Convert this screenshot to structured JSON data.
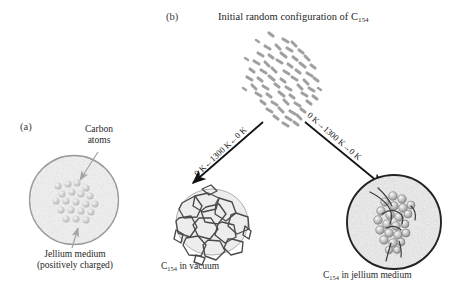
{
  "figure": {
    "panel_a": {
      "label": "(a)",
      "carbon_atoms_label_line1": "Carbon",
      "carbon_atoms_label_line2": "atoms",
      "medium_label_line1": "Jellium medium",
      "medium_label_line2": "(positively charged)",
      "circle_border_color": "#9a9a9a",
      "circle_fill_color": "#f2f2f2",
      "atom_color": "#cfcfcf",
      "atom_count": 20,
      "arrow_color": "#a0a0a0"
    },
    "panel_b": {
      "label": "(b)",
      "title_prefix": "Initial random configuration of C",
      "title_subscript": "154",
      "cluster_color": "#9b9b9b",
      "left_arrow_label": "0 K←1300 K←0 K",
      "right_arrow_label": "0 K→1300 K→0 K",
      "arrow_color": "#111111",
      "left_caption_prefix": "C",
      "left_caption_subscript": "154",
      "left_caption_suffix": " in vacuum",
      "right_caption_prefix": "C",
      "right_caption_subscript": "154",
      "right_caption_suffix": " in jellium medium",
      "jellium_circle_border_color": "#232323",
      "jellium_circle_fill_color": "#efefef",
      "cage_color": "#4a4a4a"
    }
  }
}
